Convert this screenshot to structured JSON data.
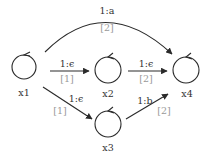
{
  "diagram": {
    "type": "weighted-transducer",
    "nodes": [
      {
        "id": "x1",
        "label": "x1",
        "cx": 24,
        "cy": 67,
        "r": 12
      },
      {
        "id": "x2",
        "label": "x2",
        "cx": 108,
        "cy": 70,
        "r": 13
      },
      {
        "id": "x3",
        "label": "x3",
        "cx": 108,
        "cy": 124,
        "r": 13
      },
      {
        "id": "x4",
        "label": "x4",
        "cx": 186,
        "cy": 70,
        "r": 13
      }
    ],
    "edges": [
      {
        "from": "x1",
        "to": "x4",
        "label": "1:a",
        "weight": "[2]"
      },
      {
        "from": "x1",
        "to": "x2",
        "label": "1:ϵ",
        "weight": "[1]"
      },
      {
        "from": "x2",
        "to": "x4",
        "label": "1:ϵ",
        "weight": "[2]"
      },
      {
        "from": "x1",
        "to": "x3",
        "label": "1:ϵ",
        "weight": "[1]"
      },
      {
        "from": "x3",
        "to": "x4",
        "label": "1:b",
        "weight": "[2]"
      }
    ],
    "colors": {
      "stroke": "#2a2a2a",
      "label": "#333333",
      "weight": "#9a9a9a",
      "background": "#ffffff"
    }
  }
}
